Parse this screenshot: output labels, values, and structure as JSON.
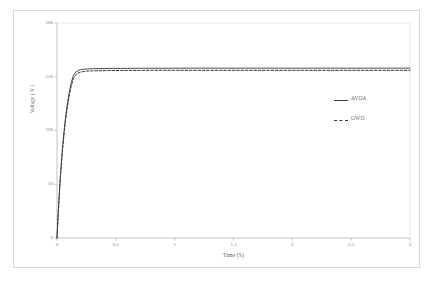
{
  "chart_data": {
    "type": "line",
    "title": "",
    "xlabel": "Time (S)",
    "ylabel": "Voltage ( V )",
    "xlim": [
      0,
      3
    ],
    "ylim": [
      0,
      200
    ],
    "grid": false,
    "legend_position": "right-middle",
    "xticks": [
      "0",
      "0.5",
      "1",
      "1.5",
      "2",
      "2.5",
      "3"
    ],
    "xtick_values": [
      0,
      0.5,
      1,
      1.5,
      2,
      2.5,
      3
    ],
    "yticks": [
      "0",
      "50",
      "100",
      "150",
      "200"
    ],
    "ytick_values": [
      0,
      50,
      100,
      150,
      200
    ],
    "x": [
      0,
      0.01,
      0.02,
      0.03,
      0.04,
      0.05,
      0.06,
      0.07,
      0.08,
      0.09,
      0.1,
      0.12,
      0.14,
      0.16,
      0.18,
      0.2,
      0.22,
      0.25,
      0.28,
      0.3,
      0.35,
      0.4,
      0.45,
      0.5,
      0.6,
      0.7,
      0.8,
      0.9,
      1.0,
      1.2,
      1.4,
      1.6,
      1.8,
      2.0,
      2.2,
      2.4,
      2.6,
      2.8,
      3.0
    ],
    "series": [
      {
        "name": "AVOA",
        "style": "solid",
        "color": "#3a3a3a",
        "steady_state": 158,
        "values": [
          0,
          22.4,
          42.1,
          59.4,
          74.5,
          87.8,
          99.4,
          109.6,
          118.5,
          126.3,
          133.1,
          144.0,
          151.5,
          154.4,
          155.8,
          156.5,
          156.9,
          157.2,
          157.4,
          157.5,
          157.6,
          157.7,
          157.7,
          157.8,
          157.8,
          157.9,
          157.9,
          157.9,
          158.0,
          158.0,
          158.0,
          158.0,
          158.0,
          158.0,
          158.0,
          158.0,
          158.0,
          158.0,
          158.0
        ]
      },
      {
        "name": "GWO",
        "style": "dashed",
        "color": "#3a3a3a",
        "steady_state": 156,
        "values": [
          0,
          21.8,
          41.0,
          57.9,
          72.6,
          85.5,
          96.9,
          106.9,
          115.6,
          123.3,
          130.0,
          141.0,
          148.6,
          151.9,
          153.5,
          154.3,
          154.8,
          155.2,
          155.4,
          155.5,
          155.6,
          155.7,
          155.8,
          155.8,
          155.9,
          155.9,
          156.0,
          156.0,
          156.0,
          156.0,
          156.0,
          156.0,
          156.0,
          156.0,
          156.0,
          156.0,
          156.0,
          156.0,
          156.0
        ]
      }
    ],
    "legend": [
      {
        "label": "AVOA",
        "style": "solid"
      },
      {
        "label": "GWO",
        "style": "dashed"
      }
    ]
  }
}
